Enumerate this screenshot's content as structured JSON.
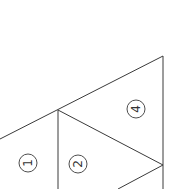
{
  "diagram": {
    "type": "triangle-subdivision",
    "stroke_color": "#3a3a3a",
    "background": "#ffffff",
    "lines": [
      {
        "id": "top-edge",
        "x1": 0,
        "y1": 139,
        "x2": 163,
        "y2": 56
      },
      {
        "id": "right-edge",
        "x1": 163,
        "y1": 56,
        "x2": 163,
        "y2": 189
      },
      {
        "id": "inner-vertical",
        "x1": 58,
        "y1": 110,
        "x2": 58,
        "y2": 189
      },
      {
        "id": "inner-diagonal-upper",
        "x1": 58,
        "y1": 110,
        "x2": 163,
        "y2": 165
      },
      {
        "id": "inner-diagonal-lower",
        "x1": 163,
        "y1": 165,
        "x2": 118,
        "y2": 189
      }
    ],
    "labels": [
      {
        "id": "region-1",
        "text": "1",
        "cx": 28,
        "cy": 163
      },
      {
        "id": "region-2",
        "text": "2",
        "cx": 78,
        "cy": 164
      },
      {
        "id": "region-4",
        "text": "4",
        "cx": 136,
        "cy": 109
      }
    ]
  }
}
